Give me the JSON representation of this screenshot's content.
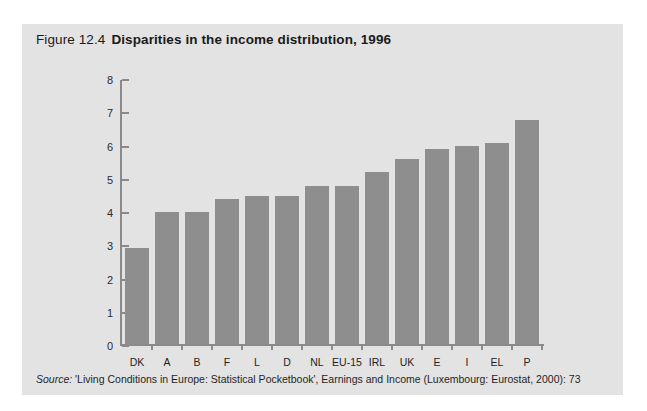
{
  "figure": {
    "number": "Figure 12.4",
    "title": "Disparities in the income distribution, 1996",
    "source_word": "Source:",
    "source_text": " 'Living Conditions in Europe: Statistical Pocketbook', Earnings and Income (Luxembourg: Eurostat, 2000): 73"
  },
  "colors": {
    "panel_background": "#e3e3e3",
    "bar_fill": "#8e8e8e",
    "axis": "#8a8a8a",
    "text": "#1a1a1a",
    "page_background": "#ffffff"
  },
  "chart_data": {
    "type": "bar",
    "title": "Disparities in the income distribution, 1996",
    "xlabel": "",
    "ylabel": "",
    "ylim": [
      0,
      8
    ],
    "yticks": [
      0,
      1,
      2,
      3,
      4,
      5,
      6,
      7,
      8
    ],
    "ytick_labels": [
      "0",
      "1",
      "2",
      "3",
      "4",
      "5",
      "6",
      "7",
      "8"
    ],
    "grid": false,
    "legend": false,
    "categories": [
      "DK",
      "A",
      "B",
      "F",
      "L",
      "D",
      "NL",
      "EU-15",
      "IRL",
      "UK",
      "E",
      "I",
      "EL",
      "P"
    ],
    "values": [
      2.9,
      4.0,
      4.0,
      4.4,
      4.5,
      4.5,
      4.8,
      4.8,
      5.2,
      5.6,
      5.9,
      6.0,
      6.1,
      6.8
    ]
  }
}
